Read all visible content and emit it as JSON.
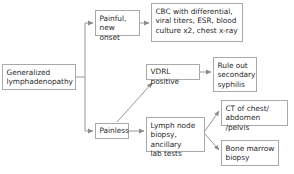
{
  "diagram": {
    "type": "flowchart",
    "colors": {
      "box_border": "#a9a9a9",
      "box_fill": "#ffffff",
      "text": "#2b2b2b",
      "edge": "#8c8c8c",
      "background": "#ffffff"
    },
    "nodes": [
      {
        "id": "root",
        "label": "Generalized\nlymphadenopathy",
        "x": 2,
        "y": 64,
        "w": 74,
        "h": 26
      },
      {
        "id": "painful",
        "label": "Painful,\nnew onset",
        "x": 95,
        "y": 10,
        "w": 45,
        "h": 26
      },
      {
        "id": "cbc",
        "label": "CBC with differential,\nviral titers, ESR, blood\nculture x2, chest x-ray",
        "x": 151,
        "y": 3,
        "w": 92,
        "h": 39
      },
      {
        "id": "vdrl",
        "label": "VDRL positive",
        "x": 146,
        "y": 64,
        "w": 54,
        "h": 16
      },
      {
        "id": "syphilis",
        "label": "Rule out\nsecondary\nsyphilis",
        "x": 213,
        "y": 57,
        "w": 44,
        "h": 35
      },
      {
        "id": "painless",
        "label": "Painless",
        "x": 95,
        "y": 123,
        "w": 34,
        "h": 16
      },
      {
        "id": "biopsy",
        "label": "Lymph node\nbiopsy, ancillary\nlab tests",
        "x": 146,
        "y": 117,
        "w": 59,
        "h": 35
      },
      {
        "id": "ct",
        "label": "CT of chest/\nabdomen /pelvis",
        "x": 221,
        "y": 100,
        "w": 67,
        "h": 26
      },
      {
        "id": "bonemarrow",
        "label": "Bone marrow\nbiopsy",
        "x": 221,
        "y": 140,
        "w": 58,
        "h": 26
      }
    ],
    "edges": [
      {
        "id": "root-trunk-up",
        "from": "root",
        "to": "painful",
        "style": "orthogonal"
      },
      {
        "id": "root-trunk-down",
        "from": "root",
        "to": "painless",
        "style": "orthogonal"
      },
      {
        "id": "painful-cbc",
        "from": "painful",
        "to": "cbc",
        "style": "straight"
      },
      {
        "id": "painless-vdrl",
        "from": "painless",
        "to": "vdrl",
        "style": "diagonal"
      },
      {
        "id": "painless-biopsy",
        "from": "painless",
        "to": "biopsy",
        "style": "straight"
      },
      {
        "id": "vdrl-syphilis",
        "from": "vdrl",
        "to": "syphilis",
        "style": "straight"
      },
      {
        "id": "biopsy-ct",
        "from": "biopsy",
        "to": "ct",
        "style": "diagonal"
      },
      {
        "id": "biopsy-bone",
        "from": "biopsy",
        "to": "bonemarrow",
        "style": "diagonal"
      }
    ]
  }
}
